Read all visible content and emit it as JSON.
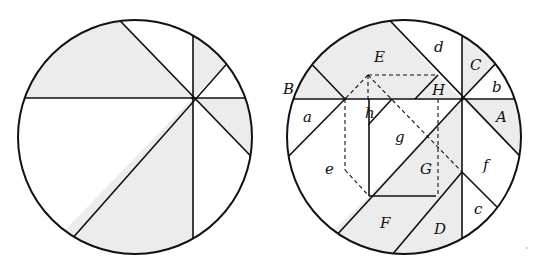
{
  "figure": {
    "colors": {
      "stroke": "#111111",
      "shade": "#ececec",
      "background": "#ffffff"
    }
  },
  "left_circle": {
    "shaded_regions": 4,
    "labels": []
  },
  "right_circle": {
    "labels": {
      "E": "E",
      "d": "d",
      "C": "C",
      "b": "b",
      "B": "B",
      "H": "H",
      "A": "A",
      "a": "a",
      "h": "h",
      "g": "g",
      "e": "e",
      "G": "G",
      "f": "f",
      "F": "F",
      "D": "D",
      "c": "c"
    },
    "shaded_pieces": [
      "A",
      "B",
      "C",
      "D",
      "E",
      "F",
      "G",
      "H"
    ],
    "unshaded_pieces": [
      "a",
      "b",
      "c",
      "d",
      "e",
      "f",
      "g",
      "h"
    ]
  }
}
